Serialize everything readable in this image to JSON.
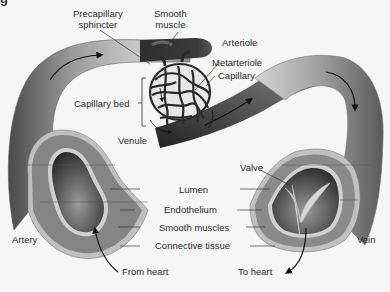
{
  "figure": {
    "clipped_title": "g"
  },
  "labels": {
    "precapillary_sphincter": [
      "Precapillary",
      "sphincter"
    ],
    "smooth_muscle": [
      "Smooth",
      "muscle"
    ],
    "arteriole": "Arteriole",
    "metarteriole": "Metarteriole",
    "capillary": "Capillary",
    "capillary_bed": "Capillary bed",
    "venule": "Venule",
    "valve": "Valve",
    "lumen": "Lumen",
    "endothelium": "Endothelium",
    "smooth_muscles": "Smooth muscles",
    "connective_tissue": "Connective tissue",
    "artery": "Artery",
    "vein": "Vein",
    "from_heart": "From heart",
    "to_heart": "To heart"
  },
  "colors": {
    "background": "#f6f6f6",
    "vessel_dark": "#3a3a3a",
    "vessel_mid": "#7a7a7a",
    "vessel_light": "#bdbdbd",
    "muscle_layer": "#8c8c8c",
    "endothelium": "#d0d0d0",
    "lumen": "#4a4a4a",
    "text": "#2a2a2a"
  }
}
